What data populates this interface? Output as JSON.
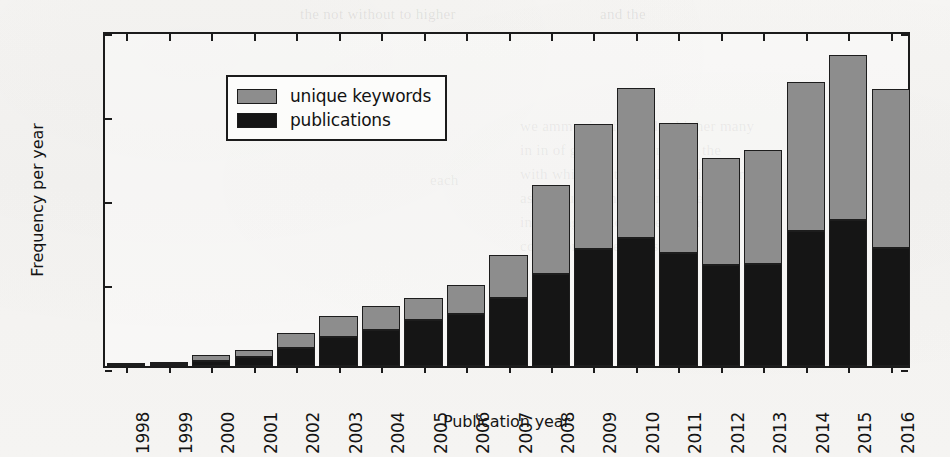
{
  "chart_data": {
    "type": "bar",
    "subtype": "stacked-vertical",
    "title": "",
    "xlabel": "Publication year",
    "ylabel": "Frequency per year",
    "categories": [
      "1998",
      "1999",
      "2000",
      "2001",
      "2002",
      "2003",
      "2004",
      "2005",
      "2006",
      "2007",
      "2008",
      "2009",
      "2010",
      "2011",
      "2012",
      "2013",
      "2014",
      "2015",
      "2016"
    ],
    "series": [
      {
        "name": "publications",
        "color": "#151515",
        "values": [
          60,
          110,
          310,
          520,
          1050,
          1700,
          2150,
          2750,
          3100,
          4050,
          5450,
          6950,
          7600,
          6700,
          6000,
          6100,
          8050,
          8700,
          7000
        ]
      },
      {
        "name": "unique keywords",
        "color": "#8d8d8d",
        "values": [
          60,
          110,
          340,
          430,
          900,
          1300,
          1450,
          1300,
          1700,
          2550,
          5300,
          7450,
          8950,
          7750,
          6400,
          6750,
          8850,
          9800,
          9500
        ]
      }
    ],
    "totals": [
      120,
      220,
      650,
      950,
      1950,
      3000,
      3600,
      4050,
      4800,
      6600,
      10750,
      14400,
      16550,
      14450,
      12400,
      12850,
      16900,
      18500,
      16500
    ],
    "ylim": [
      0,
      20000
    ],
    "yticks": [
      0,
      5000,
      10000,
      15000,
      20000
    ],
    "ytick_labels": [
      "0",
      "5000",
      "10000",
      "15000",
      "20000"
    ],
    "grid": false,
    "legend": {
      "position": "upper left",
      "entries": [
        {
          "label": "unique keywords",
          "color": "#8d8d8d",
          "swatch": "legend-swatch-keywords"
        },
        {
          "label": "publications",
          "color": "#151515",
          "swatch": "legend-swatch-publications"
        }
      ]
    },
    "axis_colors": {
      "frame": "#1b1b1b",
      "text": "#141414",
      "background": "#f4f3f1"
    }
  }
}
